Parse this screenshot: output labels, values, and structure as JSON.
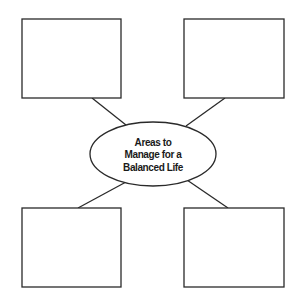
{
  "diagram": {
    "type": "concept-map",
    "center": {
      "lines": [
        "Areas to",
        "Manage for a",
        "Balanced Life"
      ]
    },
    "boxes": [
      {
        "position": "top-left",
        "label": ""
      },
      {
        "position": "top-right",
        "label": ""
      },
      {
        "position": "bottom-left",
        "label": ""
      },
      {
        "position": "bottom-right",
        "label": ""
      }
    ]
  }
}
